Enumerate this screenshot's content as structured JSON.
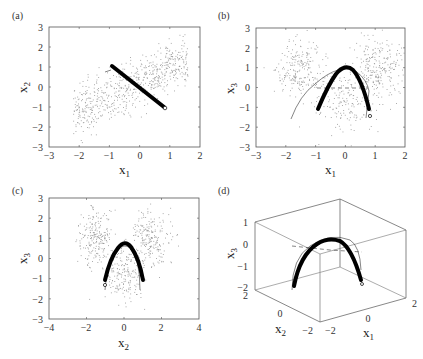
{
  "chart_data": [
    {
      "panel": "(a)",
      "type": "scatter",
      "xlabel": "x1",
      "ylabel": "x2",
      "xlim": [
        -3,
        2
      ],
      "ylim": [
        -3,
        3
      ],
      "xticks": [
        -3,
        -2,
        -1,
        0,
        1,
        2
      ],
      "yticks": [
        -3,
        -2,
        -1,
        0,
        1,
        2,
        3
      ],
      "description": "Scattered points in an elongated band from lower-left to upper-right; thick black fitted line from (-0.9, 1.05) to (0.9, -1.0) with small circle at end; short thin line near (-1.0, 0.8)",
      "thick_curve": [
        [
          -0.9,
          1.05
        ],
        [
          -0.5,
          0.62
        ],
        [
          0.0,
          0.1
        ],
        [
          0.5,
          -0.5
        ],
        [
          0.9,
          -1.0
        ]
      ],
      "thin_curve": [
        [
          -1.05,
          0.8
        ],
        [
          -0.85,
          0.85
        ]
      ],
      "end_marker": [
        0.9,
        -1.0
      ]
    },
    {
      "panel": "(b)",
      "type": "scatter",
      "xlabel": "x1",
      "ylabel": "x3",
      "xlim": [
        -3,
        2
      ],
      "ylim": [
        -3,
        3
      ],
      "xticks": [
        -3,
        -2,
        -1,
        0,
        1,
        2
      ],
      "yticks": [
        -3,
        -2,
        -1,
        0,
        1,
        2,
        3
      ],
      "description": "Scattered points in two lobes upper-left and upper-right plus central cluster; thick black parabola peaking near (-0.05, 0.55); thin outer parabola; dashed horizontal line at x3 = 0",
      "thick_curve": [
        [
          -0.9,
          -1.05
        ],
        [
          -0.6,
          -0.25
        ],
        [
          -0.3,
          0.3
        ],
        [
          -0.05,
          0.55
        ],
        [
          0.2,
          0.4
        ],
        [
          0.5,
          -0.1
        ],
        [
          0.8,
          -1.05
        ]
      ],
      "thin_curve": [
        [
          -1.15,
          -1.5
        ],
        [
          -0.8,
          -0.4
        ],
        [
          -0.4,
          0.3
        ],
        [
          0.0,
          0.5
        ],
        [
          0.4,
          0.35
        ],
        [
          0.7,
          -0.2
        ],
        [
          0.75,
          -1.5
        ]
      ],
      "dashed_line": [
        [
          -0.9,
          0.0
        ],
        [
          0.8,
          0.0
        ]
      ],
      "end_marker": [
        0.9,
        -1.35
      ]
    },
    {
      "panel": "(c)",
      "type": "scatter",
      "xlabel": "x2",
      "ylabel": "x3",
      "xlim": [
        -4,
        4
      ],
      "ylim": [
        -3,
        3
      ],
      "xticks": [
        -4,
        -2,
        0,
        2,
        4
      ],
      "yticks": [
        -3,
        -2,
        -1,
        0,
        1,
        2,
        3
      ],
      "description": "Scattered points in a V/horseshoe shape; thick black parabola peaking near (0.05, 0.5); thin outer curve",
      "thick_curve": [
        [
          -1.0,
          -1.05
        ],
        [
          -0.6,
          -0.2
        ],
        [
          -0.3,
          0.3
        ],
        [
          0.05,
          0.5
        ],
        [
          0.4,
          0.3
        ],
        [
          0.7,
          -0.3
        ],
        [
          1.05,
          -1.1
        ]
      ],
      "thin_curve": [
        [
          -1.0,
          -1.55
        ],
        [
          -0.7,
          -0.4
        ],
        [
          -0.2,
          0.4
        ],
        [
          0.2,
          0.45
        ],
        [
          0.7,
          -0.2
        ],
        [
          0.95,
          -1.5
        ]
      ],
      "end_marker": [
        -1.0,
        -1.35
      ]
    },
    {
      "panel": "(d)",
      "type": "line3d",
      "xlabel": "x1",
      "ylabel": "x2",
      "zlabel": "x3",
      "xlim": [
        -2,
        2
      ],
      "ylim": [
        -2,
        2
      ],
      "zlim": [
        -2,
        1
      ],
      "xticks": [
        -2,
        0,
        2
      ],
      "yticks": [
        -2,
        0,
        2
      ],
      "zticks": [
        -2,
        -1,
        0,
        1
      ],
      "description": "3D box with thick black arch-shaped curve peaking at about x3 = 0.3; thin outer curve and dashed line near x3 = 0"
    }
  ],
  "panels": {
    "a": {
      "label": "(a)",
      "xlabel": "x",
      "xsub": "1",
      "ylabel": "x",
      "ysub": "2",
      "xticks": [
        "-3",
        "-2",
        "-1",
        "0",
        "1",
        "2"
      ],
      "yticks": [
        "-3",
        "-2",
        "-1",
        "0",
        "1",
        "2",
        "3"
      ]
    },
    "b": {
      "label": "(b)",
      "xlabel": "x",
      "xsub": "1",
      "ylabel": "x",
      "ysub": "3",
      "xticks": [
        "-3",
        "-2",
        "-1",
        "0",
        "1",
        "2"
      ],
      "yticks": [
        "-3",
        "-2",
        "-1",
        "0",
        "1",
        "2",
        "3"
      ]
    },
    "c": {
      "label": "(c)",
      "xlabel": "x",
      "xsub": "2",
      "ylabel": "x",
      "ysub": "3",
      "xticks": [
        "-4",
        "-2",
        "0",
        "2",
        "4"
      ],
      "yticks": [
        "-3",
        "-2",
        "-1",
        "0",
        "1",
        "2",
        "3"
      ]
    },
    "d": {
      "label": "(d)",
      "x1label": "x",
      "x1sub": "1",
      "x2label": "x",
      "x2sub": "2",
      "x3label": "x",
      "x3sub": "3",
      "zticks": [
        "1",
        "0",
        "-1",
        "-2"
      ],
      "x2ticks": [
        "2",
        "0",
        "-2"
      ],
      "x1ticks": [
        "-2",
        "0",
        "2"
      ]
    }
  },
  "colors": {
    "axis": "#555555",
    "points": "#9a9a9a",
    "curve": "#000000"
  }
}
